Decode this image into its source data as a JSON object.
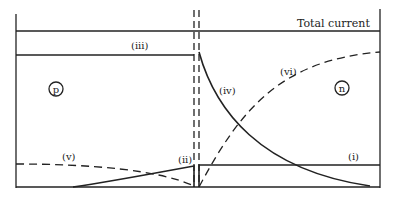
{
  "diagram": {
    "title_label": "Total current",
    "regions": {
      "p_label": "p",
      "n_label": "n"
    },
    "curves": {
      "i": "(i)",
      "ii": "(ii)",
      "iii": "(iii)",
      "iv": "(iv)",
      "v": "(v)",
      "vi": "(vi)"
    },
    "colors": {
      "ink": "#222222",
      "background": "#ffffff"
    }
  }
}
